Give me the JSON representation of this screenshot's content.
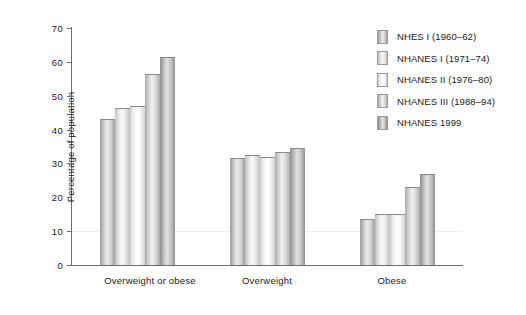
{
  "chart_data": {
    "type": "bar",
    "title": "",
    "subtitle": "",
    "xlabel": "",
    "ylabel": "Percentage of population",
    "ylim": [
      0,
      70
    ],
    "yticks": [
      0,
      10,
      20,
      30,
      40,
      50,
      60,
      70
    ],
    "ytick_labels": [
      "0",
      "10",
      "20",
      "30",
      "40",
      "50",
      "60",
      "70"
    ],
    "grid": false,
    "legend_position": "top-right",
    "categories": [
      "Overweight or obese",
      "Overweight",
      "Obese"
    ],
    "series": [
      {
        "name": "NHES I (1960–62)",
        "values": [
          43.0,
          31.5,
          13.5
        ],
        "color": "#b0b0b0"
      },
      {
        "name": "NHANES I (1971–74)",
        "values": [
          46.5,
          32.5,
          15.0
        ],
        "color": "#dcdcdc"
      },
      {
        "name": "NHANES II (1976–80)",
        "values": [
          47.0,
          32.0,
          15.0
        ],
        "color": "#f0f0f0"
      },
      {
        "name": "NHANES III (1988–94)",
        "values": [
          56.5,
          33.5,
          23.0
        ],
        "color": "#c4c4c4"
      },
      {
        "name": "NHANES 1999",
        "values": [
          61.5,
          34.5,
          27.0
        ],
        "color": "#a6a6a6"
      }
    ]
  },
  "axes": {
    "y_title": "Percentage of population",
    "y_tick_labels": [
      "70",
      "60",
      "50",
      "40",
      "30",
      "20",
      "10",
      "0"
    ],
    "x_tick_labels": [
      "Overweight or obese",
      "Overweight",
      "Obese"
    ]
  },
  "legend": {
    "items": [
      {
        "label": "NHES I (1960–62)"
      },
      {
        "label": "NHANES I (1971–74)"
      },
      {
        "label": "NHANES II (1976–80)"
      },
      {
        "label": "NHANES III (1988–94)"
      },
      {
        "label": "NHANES 1999"
      }
    ]
  }
}
